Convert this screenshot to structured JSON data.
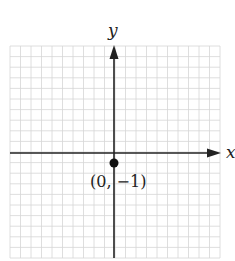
{
  "chart_data": {
    "type": "scatter",
    "title": "",
    "xlabel": "x",
    "ylabel": "y",
    "grid": true,
    "xlim": [
      -10,
      10
    ],
    "ylim": [
      -10,
      10
    ],
    "points": [
      {
        "x": 0,
        "y": -1,
        "label": "(0, −1)"
      }
    ]
  },
  "axes": {
    "x_label": "x",
    "y_label": "y"
  },
  "point": {
    "label": "(0, −1)"
  },
  "colors": {
    "grid": "#d4d4d4",
    "axis": "#222222",
    "point": "#111111"
  }
}
